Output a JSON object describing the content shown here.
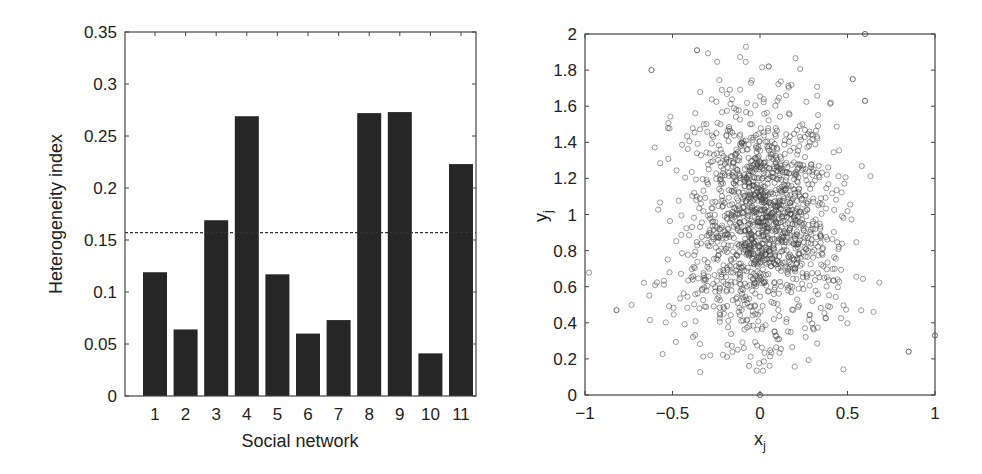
{
  "chart_data": [
    {
      "type": "bar",
      "title": "",
      "xlabel": "Social network",
      "ylabel": "Heterogeneity index",
      "categories": [
        "1",
        "2",
        "3",
        "4",
        "5",
        "6",
        "7",
        "8",
        "9",
        "10",
        "11"
      ],
      "values": [
        0.119,
        0.064,
        0.169,
        0.269,
        0.117,
        0.06,
        0.073,
        0.272,
        0.273,
        0.041,
        0.223
      ],
      "ylim": [
        0,
        0.35
      ],
      "yticks": [
        0,
        0.05,
        0.1,
        0.15,
        0.2,
        0.25,
        0.3,
        0.35
      ],
      "ytick_labels": [
        "0",
        "0.05",
        "0.1",
        "0.15",
        "0.2",
        "0.25",
        "0.3",
        "0.35"
      ],
      "reference_line": {
        "style": "dashed",
        "value": 0.157
      },
      "bar_color": "#262626",
      "grid": false,
      "legend": null
    },
    {
      "type": "scatter",
      "title": "",
      "xlabel": "x_j",
      "ylabel": "y_j",
      "xlim": [
        -1,
        1
      ],
      "ylim": [
        0,
        2
      ],
      "xticks": [
        -1,
        -0.5,
        0,
        0.5,
        1
      ],
      "xtick_labels": [
        "−1",
        "−0.5",
        "0",
        "0.5",
        "1"
      ],
      "yticks": [
        0,
        0.2,
        0.4,
        0.6,
        0.8,
        1,
        1.2,
        1.4,
        1.6,
        1.8,
        2
      ],
      "ytick_labels": [
        "0",
        "0.2",
        "0.4",
        "0.6",
        "0.8",
        "1",
        "1.2",
        "1.4",
        "1.6",
        "1.8",
        "2"
      ],
      "marker": "open circle",
      "marker_color": "#444444",
      "approx_point_count": 1500,
      "distribution": {
        "center": [
          0.0,
          0.95
        ],
        "x_spread_sd": 0.2,
        "y_spread_sd": 0.33,
        "notes": "dense cloud centered near (0, 0.9); outliers near (0.6, 2.0), (1.0, 0.33), (0, 0), (-0.62, 1.8), (-0.36, 1.9)"
      },
      "notable_points": [
        {
          "x": 0.6,
          "y": 2.0
        },
        {
          "x": -0.36,
          "y": 1.91
        },
        {
          "x": -0.62,
          "y": 1.8
        },
        {
          "x": 0.05,
          "y": 1.82
        },
        {
          "x": 1.0,
          "y": 0.33
        },
        {
          "x": 0.0,
          "y": 0.0
        },
        {
          "x": 0.85,
          "y": 0.24
        },
        {
          "x": -0.82,
          "y": 0.47
        },
        {
          "x": 0.53,
          "y": 1.75
        },
        {
          "x": 0.6,
          "y": 1.63
        }
      ],
      "grid": false,
      "legend": null
    }
  ],
  "left_chart": {
    "xlabel": "Social network",
    "ylabel": "Heterogeneity index"
  },
  "right_chart": {
    "xlabel_main": "x",
    "xlabel_sub": "j",
    "ylabel_main": "y",
    "ylabel_sub": "j"
  }
}
